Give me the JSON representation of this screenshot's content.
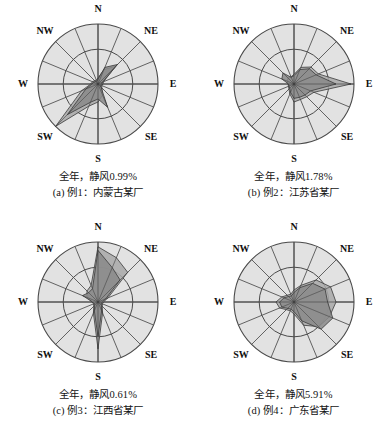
{
  "figure": {
    "type": "wind-rose-grid",
    "rows": 2,
    "cols": 2
  },
  "style": {
    "disc_fill": "#e2e2e2",
    "disc_stroke": "#4a4a4a",
    "spoke_stroke": "#4a4a4a",
    "poly_light_fill": "#a8a8a8",
    "poly_dark_fill": "#8a8a8a",
    "poly_stroke": "#3a3a3a",
    "text_color": "#131313",
    "page_bg": "#ffffff"
  },
  "compass": {
    "labels": [
      "N",
      "NE",
      "E",
      "SE",
      "S",
      "SW",
      "W",
      "NW"
    ],
    "n": "N",
    "ne": "NE",
    "e": "E",
    "se": "SE",
    "s": "S",
    "sw": "SW",
    "w": "W",
    "nw": "NW"
  },
  "chart_data": [
    {
      "id": "rose-a",
      "type": "line",
      "title": "(a) 例1：内蒙古某厂",
      "subtitle": "全年，静风0.99%",
      "calm_label": "全年，静风0.99%",
      "calm_percent": 0.99,
      "directions": [
        "N",
        "NNE",
        "NE",
        "ENE",
        "E",
        "ESE",
        "SE",
        "SSE",
        "S",
        "SSW",
        "SW",
        "WSW",
        "W",
        "WNW",
        "NW",
        "NNW"
      ],
      "series": [
        {
          "name": "全年风向频率",
          "fill": "#a8a8a8",
          "values": [
            0.1,
            0.26,
            0.42,
            0.1,
            0.08,
            0.07,
            0.09,
            0.2,
            0.3,
            0.4,
            1.0,
            0.3,
            0.12,
            0.1,
            0.08,
            0.07
          ]
        },
        {
          "name": "平均风速",
          "fill": "#8a8a8a",
          "values": [
            0.08,
            0.3,
            0.46,
            0.08,
            0.06,
            0.05,
            0.07,
            0.42,
            0.25,
            0.33,
            0.72,
            0.22,
            0.1,
            0.08,
            0.06,
            0.05
          ]
        }
      ],
      "rmax": 1.0,
      "rings": [
        0.58,
        1.0
      ],
      "spokes": 16,
      "grid": true,
      "legend": "none"
    },
    {
      "id": "rose-b",
      "type": "line",
      "title": "(b) 例2：江苏省某厂",
      "subtitle": "全年，静风1.78%",
      "calm_label": "全年，静风1.78%",
      "calm_percent": 1.78,
      "directions": [
        "N",
        "NNE",
        "NE",
        "ENE",
        "E",
        "ESE",
        "SE",
        "SSE",
        "S",
        "SSW",
        "SW",
        "WSW",
        "W",
        "WNW",
        "NW",
        "NNW"
      ],
      "series": [
        {
          "name": "全年风向频率",
          "fill": "#a8a8a8",
          "values": [
            0.16,
            0.3,
            0.4,
            0.44,
            0.95,
            0.36,
            0.3,
            0.28,
            0.3,
            0.18,
            0.12,
            0.1,
            0.1,
            0.12,
            0.14,
            0.13
          ]
        },
        {
          "name": "平均风速",
          "fill": "#8a8a8a",
          "values": [
            0.14,
            0.26,
            0.36,
            0.4,
            0.7,
            0.3,
            0.26,
            0.24,
            0.24,
            0.15,
            0.1,
            0.09,
            0.09,
            0.22,
            0.26,
            0.12
          ]
        }
      ],
      "rmax": 1.0,
      "rings": [
        0.58,
        1.0
      ],
      "spokes": 16,
      "grid": true,
      "legend": "none"
    },
    {
      "id": "rose-c",
      "type": "line",
      "title": "(c) 例3：江西省某厂",
      "subtitle": "全年，静风0.61%",
      "calm_label": "全年，静风0.61%",
      "calm_percent": 0.61,
      "directions": [
        "N",
        "NNE",
        "NE",
        "ENE",
        "E",
        "ESE",
        "SE",
        "SSE",
        "S",
        "SSW",
        "SW",
        "WSW",
        "W",
        "WNW",
        "NW",
        "NNW"
      ],
      "series": [
        {
          "name": "全年风向频率",
          "fill": "#a8a8a8",
          "values": [
            0.92,
            0.8,
            0.7,
            0.18,
            0.09,
            0.08,
            0.1,
            0.2,
            0.78,
            0.2,
            0.1,
            0.08,
            0.1,
            0.2,
            0.26,
            0.3
          ]
        },
        {
          "name": "平均风速",
          "fill": "#8a8a8a",
          "values": [
            0.86,
            0.62,
            0.52,
            0.14,
            0.07,
            0.06,
            0.08,
            0.16,
            0.58,
            0.16,
            0.08,
            0.07,
            0.09,
            0.28,
            0.22,
            0.24
          ]
        }
      ],
      "rmax": 1.0,
      "rings": [
        0.58,
        1.0
      ],
      "spokes": 16,
      "grid": true,
      "legend": "none"
    },
    {
      "id": "rose-d",
      "type": "line",
      "title": "(d) 例4：广东省某厂",
      "subtitle": "全年，静风5.91%",
      "calm_label": "全年，静风5.91%",
      "calm_percent": 5.91,
      "directions": [
        "N",
        "NNE",
        "NE",
        "ENE",
        "E",
        "ESE",
        "SE",
        "SSE",
        "S",
        "SSW",
        "SW",
        "WSW",
        "W",
        "WNW",
        "NW",
        "NNW"
      ],
      "series": [
        {
          "name": "全年风向频率",
          "fill": "#a8a8a8",
          "values": [
            0.2,
            0.3,
            0.52,
            0.66,
            0.7,
            0.64,
            0.58,
            0.42,
            0.2,
            0.16,
            0.18,
            0.26,
            0.3,
            0.22,
            0.16,
            0.14
          ]
        },
        {
          "name": "平均风速",
          "fill": "#8a8a8a",
          "values": [
            0.16,
            0.26,
            0.44,
            0.56,
            0.56,
            0.7,
            0.64,
            0.34,
            0.16,
            0.13,
            0.15,
            0.22,
            0.24,
            0.18,
            0.13,
            0.11
          ]
        }
      ],
      "rmax": 1.0,
      "rings": [
        0.58,
        1.0
      ],
      "spokes": 16,
      "grid": true,
      "legend": "none"
    }
  ]
}
